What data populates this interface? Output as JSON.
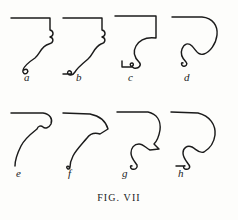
{
  "figure": {
    "caption": "FIG. VII",
    "background_color": "#fdfdfb",
    "ink_color": "#1b1b1b",
    "plate_width": 238,
    "plate_height": 220,
    "rows": 2,
    "columns": 4,
    "total_profiles": 8
  },
  "profiles": [
    {
      "id": "a",
      "label": "a",
      "row": 1,
      "column": 1,
      "description": "Cyma recta molding: straight soffit line at top, vertical fascia at right with small bead, S-curve descending to left ending in a small reverse curl.",
      "path": "M 1 6 L 40 6 L 40 18 C 44 19 44 24 40 25 C 44 26 44 31 39 32 C 31 34 30 42 25 46 C 19 50 14 54 13 58 C 12 61 15 63 17 61 C 19 59 17 56 14 58"
    },
    {
      "id": "b",
      "label": "b",
      "row": 1,
      "column": 2,
      "description": "Cyma recta with extended tail: top line, right fascia with bead, long S-curve to a small foot bump at lower left.",
      "path": "M 1 6 L 40 6 L 40 18 C 44 19 44 24 40 25 C 44 26 44 31 39 32 C 32 35 31 43 26 47 C 20 52 15 56 13 60 C 11 63 8 64 6 62 C 5 61 6 58 8 59 C 10 60 10 62 8 62 L 1 62"
    },
    {
      "id": "c",
      "label": "c",
      "row": 1,
      "column": 3,
      "description": "Ogee with deep hollow: top line, short vertical return at right, large concave sweep then convex roll down to a square fillet step at lower left.",
      "path": "M 1 4 L 42 4 L 42 26 C 34 25 26 27 22 34 C 18 41 22 47 25 50 C 28 53 25 57 20 56 C 16 55 15 51 18 51 C 20 51 20 55 16 55 L 8 55 L 8 49"
    },
    {
      "id": "d",
      "label": "d",
      "row": 1,
      "column": 4,
      "description": "Quarter round / ovolo with large bold convex bulge at right, reverse curve sweeping down-left to a fine tail curl.",
      "path": "M 2 5 L 32 5 C 43 6 48 14 47 23 C 46 32 40 40 34 42 C 28 44 26 38 22 34 C 18 30 14 32 12 37 C 10 42 13 47 16 50 C 18 52 16 55 13 54 C 11 53 11 50 13 51"
    },
    {
      "id": "e",
      "label": "e",
      "row": 2,
      "column": 1,
      "description": "Cavetto with rounded shoulder: top line, rounded right corner with small bead notch, long concave sweep descending to lower left.",
      "path": "M 1 5 L 33 5 C 40 6 43 11 41 16 C 39 20 35 21 33 19 C 31 17 28 18 27 21 C 22 25 15 30 11 38 C 7 46 5 53 5 58"
    },
    {
      "id": "f",
      "label": "f",
      "row": 2,
      "column": 2,
      "description": "Beaked cavetto: top line curving to an angular pointed beak at right, then a long concave hollow sweeping down-left to a small upturned curl.",
      "path": "M 1 5 L 28 6 C 38 8 44 14 46 21 L 38 26 C 32 24 28 26 25 30 C 20 36 14 42 11 48 C 9 52 8 56 8 59 C 8 61 6 62 5 60 C 4 59 6 57 7 59"
    },
    {
      "id": "g",
      "label": "g",
      "row": 2,
      "column": 3,
      "description": "Beaked cyma: top line, rounded right shoulder to a sharp beak point, S-curve hollow then convex roll down to a small curl at lower left.",
      "path": "M 1 4 L 32 4 C 41 6 45 13 44 22 C 43 28 41 33 38 36 L 43 41 L 34 42 C 30 40 27 36 23 36 C 18 36 15 40 15 45 C 15 50 19 54 21 57 C 22 60 19 62 16 61 C 14 60 14 57 16 58"
    },
    {
      "id": "h",
      "label": "h",
      "row": 2,
      "column": 4,
      "description": "Bold ovolo and cyma: top line, large smooth convex bulge at right, reverse S-curve descending to a small curl at lower left.",
      "path": "M 1 4 L 28 5 C 40 8 46 17 45 27 C 44 35 39 41 34 44 C 29 46 26 41 22 39 C 17 37 13 40 13 45 C 13 50 17 54 19 57 C 21 60 18 62 15 61 C 13 60 13 57 15 58 L 6 58"
    }
  ]
}
